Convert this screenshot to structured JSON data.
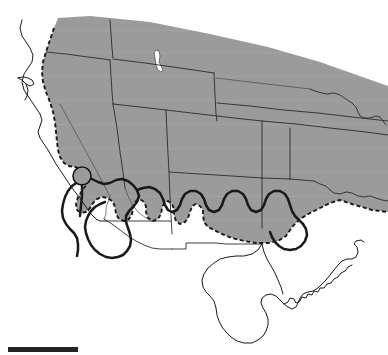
{
  "figure": {
    "kind": "species-distribution-map",
    "region_label": "Western and south-central United States",
    "background_color": "#ffffff",
    "caption": ""
  },
  "map": {
    "width": 388,
    "height": 355,
    "range_fill_color": "#9b9b9b",
    "range_outline_color": "#1a1a1a",
    "state_border_color": "#2b2b2b",
    "coastline_color": "#1a1a1a",
    "lake_fill_color": "#ffffff",
    "isolate_fill_color": "#9b9b9b"
  },
  "legend_items": [
    {
      "name": "shaded-range",
      "label": "Shaded distribution area",
      "color": "#9b9b9b"
    },
    {
      "name": "dashed-range-boundary",
      "label": "Dashed range limit",
      "color": "#1a1a1a"
    },
    {
      "name": "solid-range-boundary",
      "label": "Solid range limit",
      "color": "#1a1a1a"
    },
    {
      "name": "isolated-population",
      "label": "Isolated population",
      "color": "#9b9b9b"
    },
    {
      "name": "great-salt-lake",
      "label": "Great Salt Lake",
      "color": "#ffffff"
    }
  ],
  "scale_bar": {
    "label": "",
    "color": "#242424",
    "x": 8,
    "y": 347,
    "width": 70,
    "height": 5
  }
}
